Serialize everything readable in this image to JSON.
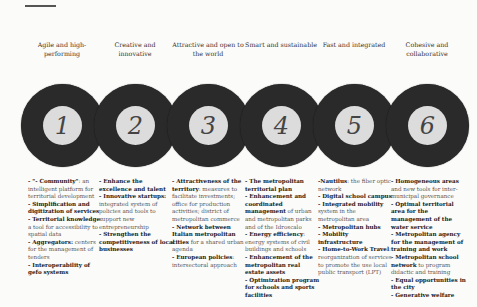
{
  "diagram": {
    "type": "six-pillar circle sequence",
    "pillars": [
      {
        "number": "1",
        "title": "Agile and high-performing",
        "items": [
          {
            "bold": "- \"- Community\"",
            "text": ": an intelligent platform for territorial development"
          },
          {
            "bold": "- Simplification and digitization of services",
            "text": ""
          },
          {
            "bold": "- Territorial knowledge",
            "text": ": a tool for accessibility to spatial data"
          },
          {
            "bold": "- Aggregators:",
            "text": " centers for the management of tenders"
          },
          {
            "bold": "- Interoperability of gefo systems",
            "text": ""
          }
        ]
      },
      {
        "number": "2",
        "title": "Creative and innovative",
        "items": [
          {
            "bold": "- Enhance the excellence and talent",
            "text": ""
          },
          {
            "bold": "- Innovative startups:",
            "text": " integrated system of policies and tools to support new entrepreneurship"
          },
          {
            "bold": "- Strengthen the competitiveness of local businesses",
            "text": ""
          }
        ]
      },
      {
        "number": "3",
        "title": "Attractive and open to the world",
        "items": [
          {
            "bold": "- Attractiveness of the territory",
            "text": ": measures to facilitate investments; office for production activities; district of metropolitan commerce"
          },
          {
            "bold": "- Network between Italian metropolitan cities",
            "text": " for a shared urban agenda"
          },
          {
            "bold": "- European policies",
            "text": ": intersectoral approach"
          }
        ]
      },
      {
        "number": "4",
        "title": "Smart and sustainable",
        "items": [
          {
            "bold": "- The metropolitan territorial plan",
            "text": ""
          },
          {
            "bold": "- Enhancement and coordinated management",
            "text": " of urban and metropolitan parks and of the Idroscalo"
          },
          {
            "bold": "- Energy efficiency",
            "text": ": energy systems of civil buildings and schools"
          },
          {
            "bold": "- Enhancement of the metropolitan real estate assets",
            "text": ""
          },
          {
            "bold": "- Optimization program for schools and sports facilities",
            "text": ""
          }
        ]
      },
      {
        "number": "5",
        "title": "Fast and integrated",
        "items": [
          {
            "bold": "-Nautilus",
            "text": ": the fiber optic network"
          },
          {
            "bold": "- Digital school campus",
            "text": ""
          },
          {
            "bold": "- Integrated mobility",
            "text": " system in the metropolitan area"
          },
          {
            "bold": "- Metropolitan hubs",
            "text": ""
          },
          {
            "bold": "- Mobility infrastructure",
            "text": ""
          },
          {
            "bold": "- Home-to-Work Travel",
            "text": ": reorganization of services to promote the use local public transport (LPT)"
          }
        ]
      },
      {
        "number": "6",
        "title": "Cohesive and collaborative",
        "items": [
          {
            "bold": "- Homogeneous areas",
            "text": " and new tools for inter-municipal governance"
          },
          {
            "bold": "- Optimal territorial area for the management of the water service",
            "text": ""
          },
          {
            "bold": "- Metropolitan agency for the management of training and work",
            "text": ""
          },
          {
            "bold": "- Metropolitan school network",
            "text": " to program didactic and training"
          },
          {
            "bold": "- Equal opportunities in the city",
            "text": ""
          },
          {
            "bold": "- Generative welfare",
            "text": ""
          }
        ]
      }
    ]
  },
  "colors": {
    "ring": "#2a2a2a",
    "hole": "#dcdcdc",
    "background": "#fbfbfa"
  }
}
